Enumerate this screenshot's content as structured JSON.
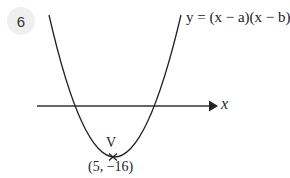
{
  "question": {
    "number": "6"
  },
  "graph": {
    "equation": "y = (x − a)(x − b)",
    "x_axis_label": "x",
    "vertex_label": "V",
    "vertex_coords": "(5, −16)",
    "colors": {
      "curve": "#222222",
      "axis": "#333333",
      "badge_bg": "#efefef"
    }
  }
}
